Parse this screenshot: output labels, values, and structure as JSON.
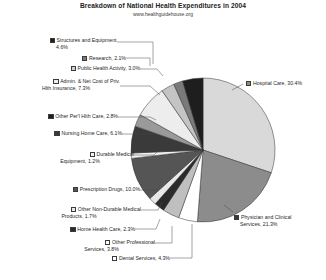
{
  "chart_data": {
    "type": "pie",
    "title": "Breakdown of National Health Expenditures in 2004",
    "subtitle": "www.healthguidehouse.org",
    "xlabel": "",
    "ylabel": "",
    "legend_position": "outside-labels",
    "grid": false,
    "categories": [
      "Hospital Care",
      "Physician and Clinical Services",
      "Dental Services",
      "Other Professional Services",
      "Home Health Care",
      "Other Non-Durable Medical Products",
      "Prescription Drugs",
      "Durable Medical Equipment",
      "Nursing Home Care",
      "Other Per'l Hlth Care",
      "Admin. & Net Cost of Priv. Hlth Insurance",
      "Public Health Activity",
      "Research",
      "Structures and Equipment"
    ],
    "values": [
      30.4,
      21.3,
      4.3,
      3.8,
      2.3,
      1.7,
      10.0,
      1.2,
      6.1,
      2.8,
      7.3,
      3.0,
      2.1,
      4.6
    ],
    "unit": "%",
    "slice_colors": [
      "#d9d9d9",
      "#8c8c8c",
      "#ffffff",
      "#bfbfbf",
      "#2b2b2b",
      "#e8e8e8",
      "#555555",
      "#f2f2f2",
      "#3a3a3a",
      "#9a9a9a",
      "#ededed",
      "#c4c4c4",
      "#7a7a7a",
      "#1e1e1e"
    ],
    "labels": [
      {
        "name": "hospital-care",
        "text": "Hospital Care, 30.4%",
        "swatch": "#8c8c8c"
      },
      {
        "name": "physician-clinical",
        "text": "Physician and Clinical",
        "text2": "Services, 21.3%",
        "swatch": "#3a3a3a"
      },
      {
        "name": "dental-services",
        "text": "Dental Services, 4.3%",
        "swatch": "#ffffff"
      },
      {
        "name": "other-professional",
        "text": "Other Professional",
        "text2": "Services, 3.8%",
        "swatch": "#ffffff"
      },
      {
        "name": "home-health-care",
        "text": "Home Health Care, 2.3%",
        "swatch": "#2b2b2b"
      },
      {
        "name": "other-non-durable",
        "text": "Other Non-Durable Medical",
        "text2": "Products, 1.7%",
        "swatch": "#e8e8e8"
      },
      {
        "name": "prescription-drugs",
        "text": "Prescription Drugs, 10.0%",
        "swatch": "#555555"
      },
      {
        "name": "durable-medical",
        "text": "Durable Medical",
        "text2": "Equipment, 1.2%",
        "swatch": "#f2f2f2"
      },
      {
        "name": "nursing-home-care",
        "text": "Nursing Home Care, 6.1%",
        "swatch": "#3a3a3a"
      },
      {
        "name": "other-personal-hlth",
        "text": "Other Per'l Hlth Care, 2.8%",
        "swatch": "#1e1e1e"
      },
      {
        "name": "admin-net-cost",
        "text": "Admin. & Net Cost of Priv.",
        "text2": "Hlth Insurance, 7.3%",
        "swatch": "#ededed"
      },
      {
        "name": "public-health",
        "text": "Public Health Activity, 3.0%",
        "swatch": "#d0d0d0"
      },
      {
        "name": "research",
        "text": "Research, 2.1%",
        "swatch": "#7a7a7a"
      },
      {
        "name": "structures-equipment",
        "text": "Structures and Equipment,",
        "text2": "4.6%",
        "swatch": "#1e1e1e"
      }
    ]
  }
}
